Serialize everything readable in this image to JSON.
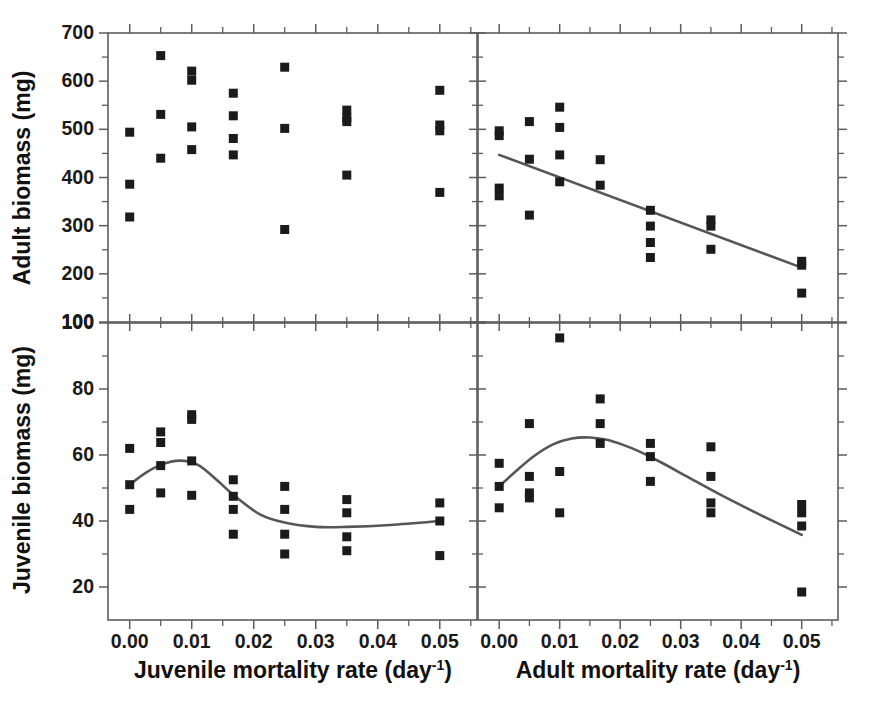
{
  "figure": {
    "layout": "2x2 panel grid, shared column x-axes",
    "panels": [
      "top-left",
      "top-right",
      "bottom-left",
      "bottom-right"
    ]
  },
  "axis_labels": {
    "y_top": "Adult biomass (mg)",
    "y_bottom": "Juvenile biomass (mg)",
    "x_left": "Juvenile mortality rate (day",
    "x_left_sup": "-1",
    "x_left_close": ")",
    "x_right": "Adult mortality rate (day",
    "x_right_sup": "-1",
    "x_right_close": ")"
  },
  "ticks": {
    "x_major": [
      "0.00",
      "0.01",
      "0.02",
      "0.03",
      "0.04",
      "0.05"
    ],
    "y_top_major": [
      "700",
      "600",
      "500",
      "400",
      "300",
      "200",
      "100"
    ],
    "y_bottom_major": [
      "100",
      "80",
      "60",
      "40",
      "20"
    ]
  },
  "colors": {
    "marker": "#1b1b1b",
    "fit_line": "#565656",
    "axis": "#5d5d5d",
    "text": "#1a1a1a",
    "background": "#ffffff"
  },
  "chart_data": [
    {
      "id": "top-left",
      "type": "scatter",
      "title": "",
      "xlabel": "Juvenile mortality rate (day-1)",
      "ylabel": "Adult biomass (mg)",
      "xlim": [
        -0.0035,
        0.056
      ],
      "ylim": [
        100,
        700
      ],
      "xticks": [
        0.0,
        0.01,
        0.02,
        0.03,
        0.04,
        0.05
      ],
      "yticks": [
        100,
        200,
        300,
        400,
        500,
        600,
        700
      ],
      "minor_xticks": [
        0.005,
        0.015,
        0.025,
        0.035,
        0.045,
        0.055
      ],
      "minor_yticks": [
        150,
        250,
        350,
        450,
        550,
        650
      ],
      "grid": false,
      "legend": "none",
      "fit": null,
      "points": [
        {
          "x": 0.0,
          "y": 494
        },
        {
          "x": 0.0,
          "y": 386
        },
        {
          "x": 0.0,
          "y": 318
        },
        {
          "x": 0.005,
          "y": 653
        },
        {
          "x": 0.005,
          "y": 531
        },
        {
          "x": 0.005,
          "y": 440
        },
        {
          "x": 0.01,
          "y": 621
        },
        {
          "x": 0.01,
          "y": 602
        },
        {
          "x": 0.01,
          "y": 505
        },
        {
          "x": 0.01,
          "y": 458
        },
        {
          "x": 0.0167,
          "y": 575
        },
        {
          "x": 0.0167,
          "y": 528
        },
        {
          "x": 0.0167,
          "y": 481
        },
        {
          "x": 0.0167,
          "y": 447
        },
        {
          "x": 0.025,
          "y": 629
        },
        {
          "x": 0.025,
          "y": 502
        },
        {
          "x": 0.025,
          "y": 292
        },
        {
          "x": 0.035,
          "y": 540
        },
        {
          "x": 0.035,
          "y": 524
        },
        {
          "x": 0.035,
          "y": 516
        },
        {
          "x": 0.035,
          "y": 405
        },
        {
          "x": 0.05,
          "y": 581
        },
        {
          "x": 0.05,
          "y": 509
        },
        {
          "x": 0.05,
          "y": 497
        },
        {
          "x": 0.05,
          "y": 369
        }
      ]
    },
    {
      "id": "top-right",
      "type": "scatter",
      "title": "",
      "xlabel": "Adult mortality rate (day-1)",
      "ylabel": "Adult biomass (mg)",
      "xlim": [
        -0.0035,
        0.056
      ],
      "ylim": [
        100,
        700
      ],
      "xticks": [
        0.0,
        0.01,
        0.02,
        0.03,
        0.04,
        0.05
      ],
      "yticks": [
        100,
        200,
        300,
        400,
        500,
        600,
        700
      ],
      "minor_xticks": [
        0.005,
        0.015,
        0.025,
        0.035,
        0.045,
        0.055
      ],
      "minor_yticks": [
        150,
        250,
        350,
        450,
        550,
        650
      ],
      "grid": false,
      "legend": "none",
      "fit": {
        "kind": "linear",
        "description": "declining linear regression",
        "x": [
          0.0,
          0.05
        ],
        "y": [
          447,
          213
        ]
      },
      "points": [
        {
          "x": 0.0,
          "y": 497
        },
        {
          "x": 0.0,
          "y": 487
        },
        {
          "x": 0.0,
          "y": 378
        },
        {
          "x": 0.0,
          "y": 362
        },
        {
          "x": 0.005,
          "y": 516
        },
        {
          "x": 0.005,
          "y": 438
        },
        {
          "x": 0.005,
          "y": 322
        },
        {
          "x": 0.01,
          "y": 546
        },
        {
          "x": 0.01,
          "y": 504
        },
        {
          "x": 0.01,
          "y": 447
        },
        {
          "x": 0.01,
          "y": 391
        },
        {
          "x": 0.0167,
          "y": 437
        },
        {
          "x": 0.0167,
          "y": 384
        },
        {
          "x": 0.025,
          "y": 332
        },
        {
          "x": 0.025,
          "y": 299
        },
        {
          "x": 0.025,
          "y": 265
        },
        {
          "x": 0.025,
          "y": 234
        },
        {
          "x": 0.035,
          "y": 312
        },
        {
          "x": 0.035,
          "y": 299
        },
        {
          "x": 0.035,
          "y": 251
        },
        {
          "x": 0.05,
          "y": 226
        },
        {
          "x": 0.05,
          "y": 218
        },
        {
          "x": 0.05,
          "y": 160
        }
      ]
    },
    {
      "id": "bottom-left",
      "type": "scatter",
      "title": "",
      "xlabel": "Juvenile mortality rate (day-1)",
      "ylabel": "Juvenile biomass (mg)",
      "xlim": [
        -0.0035,
        0.056
      ],
      "ylim": [
        10,
        100
      ],
      "xticks": [
        0.0,
        0.01,
        0.02,
        0.03,
        0.04,
        0.05
      ],
      "yticks": [
        20,
        40,
        60,
        80,
        100
      ],
      "minor_xticks": [
        0.005,
        0.015,
        0.025,
        0.035,
        0.045,
        0.055
      ],
      "minor_yticks": [
        30,
        50,
        70,
        90
      ],
      "grid": false,
      "legend": "none",
      "fit": {
        "kind": "smooth",
        "description": "wavy spline: rises to ~58 near 0.008, falls to ~38 plateau, slight rise at end",
        "x": [
          0.0,
          0.0025,
          0.005,
          0.008,
          0.011,
          0.014,
          0.017,
          0.021,
          0.025,
          0.03,
          0.035,
          0.042,
          0.05
        ],
        "y": [
          51.0,
          54.5,
          57.0,
          58.3,
          57.0,
          52.5,
          47.5,
          42.0,
          39.5,
          38.2,
          38.2,
          38.8,
          40.0
        ]
      },
      "points": [
        {
          "x": 0.0,
          "y": 62.0
        },
        {
          "x": 0.0,
          "y": 51.0
        },
        {
          "x": 0.0,
          "y": 43.5
        },
        {
          "x": 0.005,
          "y": 67.0
        },
        {
          "x": 0.005,
          "y": 63.8
        },
        {
          "x": 0.005,
          "y": 56.8
        },
        {
          "x": 0.005,
          "y": 48.5
        },
        {
          "x": 0.01,
          "y": 72.2
        },
        {
          "x": 0.01,
          "y": 70.8
        },
        {
          "x": 0.01,
          "y": 58.2
        },
        {
          "x": 0.01,
          "y": 47.8
        },
        {
          "x": 0.0167,
          "y": 52.5
        },
        {
          "x": 0.0167,
          "y": 47.5
        },
        {
          "x": 0.0167,
          "y": 43.5
        },
        {
          "x": 0.0167,
          "y": 36.0
        },
        {
          "x": 0.025,
          "y": 50.5
        },
        {
          "x": 0.025,
          "y": 43.5
        },
        {
          "x": 0.025,
          "y": 36.0
        },
        {
          "x": 0.025,
          "y": 30.0
        },
        {
          "x": 0.035,
          "y": 46.5
        },
        {
          "x": 0.035,
          "y": 42.5
        },
        {
          "x": 0.035,
          "y": 35.2
        },
        {
          "x": 0.035,
          "y": 31.0
        },
        {
          "x": 0.05,
          "y": 45.5
        },
        {
          "x": 0.05,
          "y": 40.0
        },
        {
          "x": 0.05,
          "y": 29.5
        }
      ]
    },
    {
      "id": "bottom-right",
      "type": "scatter",
      "title": "",
      "xlabel": "Adult mortality rate (day-1)",
      "ylabel": "Juvenile biomass (mg)",
      "xlim": [
        -0.0035,
        0.056
      ],
      "ylim": [
        10,
        100
      ],
      "xticks": [
        0.0,
        0.01,
        0.02,
        0.03,
        0.04,
        0.05
      ],
      "yticks": [
        20,
        40,
        60,
        80,
        100
      ],
      "minor_xticks": [
        0.005,
        0.015,
        0.025,
        0.035,
        0.045,
        0.055
      ],
      "minor_yticks": [
        30,
        50,
        70,
        90
      ],
      "grid": false,
      "legend": "none",
      "fit": {
        "kind": "smooth",
        "description": "hump peaking ~65 near 0.015, declining to ~36 at 0.05",
        "x": [
          0.0,
          0.003,
          0.006,
          0.009,
          0.012,
          0.015,
          0.018,
          0.022,
          0.026,
          0.031,
          0.036,
          0.043,
          0.05
        ],
        "y": [
          50.5,
          55.5,
          60.0,
          63.3,
          65.0,
          65.3,
          64.5,
          62.0,
          58.5,
          53.5,
          48.5,
          42.0,
          35.8
        ]
      },
      "points": [
        {
          "x": 0.0,
          "y": 57.5
        },
        {
          "x": 0.0,
          "y": 50.5
        },
        {
          "x": 0.0,
          "y": 44.0
        },
        {
          "x": 0.005,
          "y": 69.5
        },
        {
          "x": 0.005,
          "y": 53.5
        },
        {
          "x": 0.005,
          "y": 48.5
        },
        {
          "x": 0.005,
          "y": 47.0
        },
        {
          "x": 0.01,
          "y": 95.5
        },
        {
          "x": 0.01,
          "y": 55.0
        },
        {
          "x": 0.01,
          "y": 42.5
        },
        {
          "x": 0.0167,
          "y": 77.0
        },
        {
          "x": 0.0167,
          "y": 69.5
        },
        {
          "x": 0.0167,
          "y": 63.5
        },
        {
          "x": 0.025,
          "y": 63.5
        },
        {
          "x": 0.025,
          "y": 59.5
        },
        {
          "x": 0.025,
          "y": 52.0
        },
        {
          "x": 0.035,
          "y": 62.5
        },
        {
          "x": 0.035,
          "y": 53.5
        },
        {
          "x": 0.035,
          "y": 45.5
        },
        {
          "x": 0.035,
          "y": 42.5
        },
        {
          "x": 0.05,
          "y": 45.0
        },
        {
          "x": 0.05,
          "y": 42.5
        },
        {
          "x": 0.05,
          "y": 38.5
        },
        {
          "x": 0.05,
          "y": 18.5
        }
      ]
    }
  ]
}
